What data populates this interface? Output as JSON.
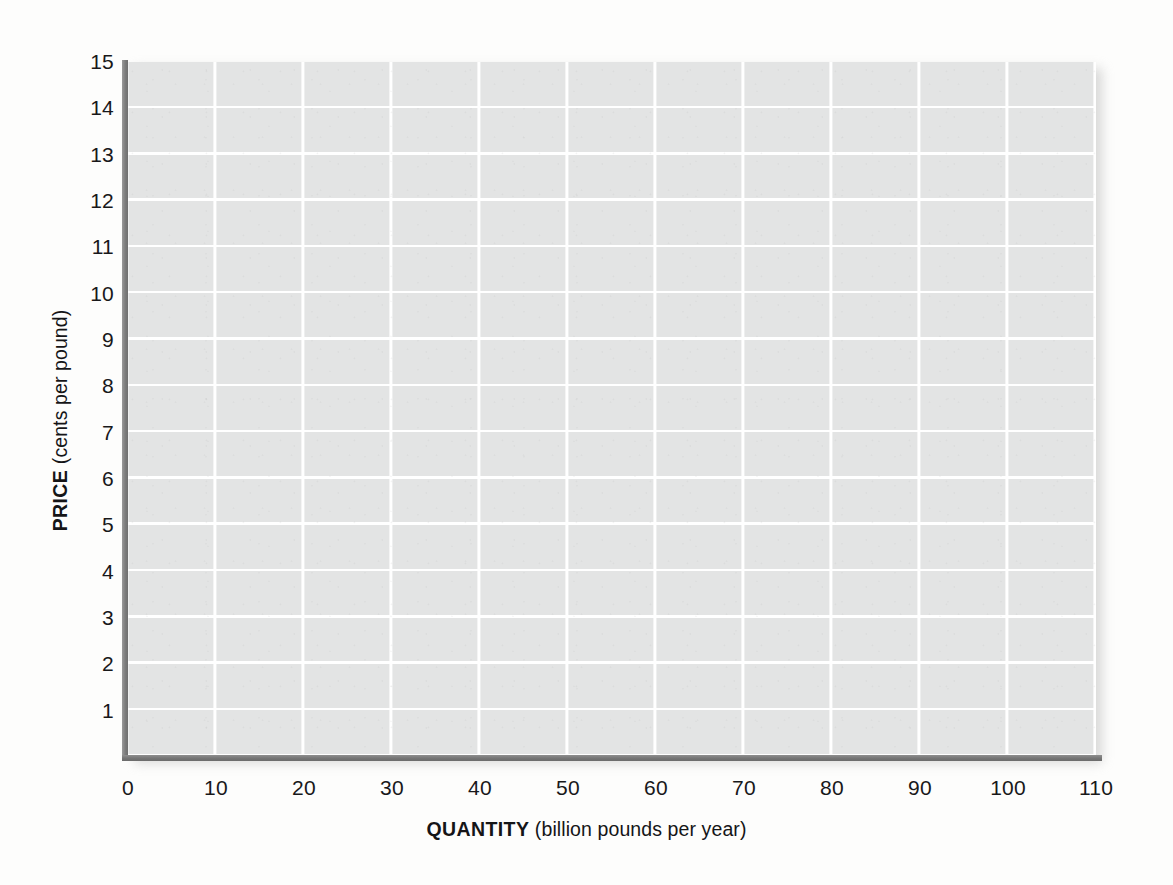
{
  "chart_data": {
    "type": "table",
    "title": "",
    "subtitle": "",
    "xlabel_bold": "QUANTITY",
    "xlabel_rest": " (billion pounds per year)",
    "ylabel_bold": "PRICE",
    "ylabel_rest": " (cents per pound)",
    "xlim": [
      0,
      110
    ],
    "ylim": [
      0,
      15
    ],
    "x_tick_step": 10,
    "y_tick_step": 1,
    "x_ticks": [
      0,
      10,
      20,
      30,
      40,
      50,
      60,
      70,
      80,
      90,
      100,
      110
    ],
    "y_ticks": [
      1,
      2,
      3,
      4,
      5,
      6,
      7,
      8,
      9,
      10,
      11,
      12,
      13,
      14,
      15
    ],
    "x_tick_labels": [
      "0",
      "10",
      "20",
      "30",
      "40",
      "50",
      "60",
      "70",
      "80",
      "90",
      "100",
      "110"
    ],
    "y_tick_labels": [
      "1",
      "2",
      "3",
      "4",
      "5",
      "6",
      "7",
      "8",
      "9",
      "10",
      "11",
      "12",
      "13",
      "14",
      "15"
    ],
    "grid": true,
    "grid_color": "#ffffff",
    "plot_background": "#e3e4e4",
    "axis_color": "#757575",
    "page_background": "#fdfdfc",
    "legend": [],
    "series": [],
    "annotations": [],
    "note": "Blank graph grid — no data series plotted"
  },
  "axes": {
    "x": {
      "bold_label": "QUANTITY",
      "unit_label": " (billion pounds per year)",
      "ticks": [
        "0",
        "10",
        "20",
        "30",
        "40",
        "50",
        "60",
        "70",
        "80",
        "90",
        "100",
        "110"
      ]
    },
    "y": {
      "bold_label": "PRICE",
      "unit_label": " (cents per pound)",
      "ticks": [
        "1",
        "2",
        "3",
        "4",
        "5",
        "6",
        "7",
        "8",
        "9",
        "10",
        "11",
        "12",
        "13",
        "14",
        "15"
      ]
    }
  }
}
